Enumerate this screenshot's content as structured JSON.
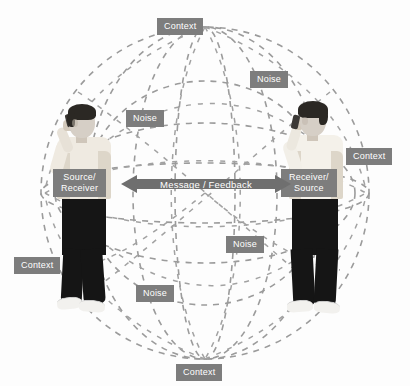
{
  "diagram": {
    "colors": {
      "label_bg": "#7d7d7d",
      "label_text": "#ffffff",
      "arrow_fill": "#6f6f6f",
      "sphere_line": "#9a9a9a",
      "background": "#fdfdfd"
    },
    "labels": {
      "context_top": "Context",
      "context_right": "Context",
      "context_left": "Context",
      "context_bottom": "Context",
      "noise_upper_left": "Noise",
      "noise_upper_right": "Noise",
      "noise_lower_right": "Noise",
      "noise_lower_left": "Noise",
      "source_receiver_line1": "Source/",
      "source_receiver_line2": "Receiver",
      "receiver_source_line1": "Receiver/",
      "receiver_source_line2": "Source",
      "message_feedback": "Message / Feedback"
    },
    "people": {
      "left_person_alt": "person on mobile phone facing right",
      "right_person_alt": "person on mobile phone facing left"
    }
  }
}
